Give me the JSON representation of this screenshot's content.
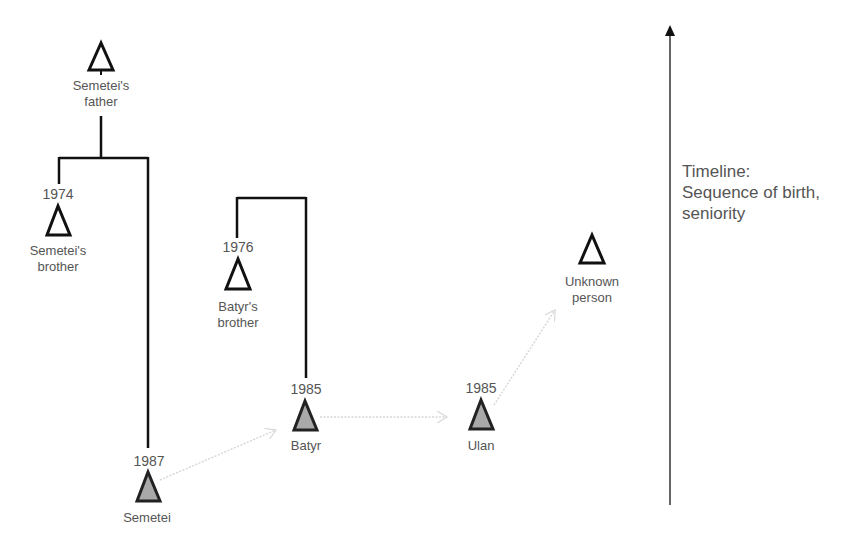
{
  "diagram": {
    "colors": {
      "line": "#111111",
      "text": "#555555",
      "ego_fill": "#a9a9a9",
      "arrow_dotted": "#d8d8d8"
    },
    "nodes": [
      {
        "id": "father",
        "label_lines": [
          "Semetei's",
          "father"
        ],
        "year": null,
        "filled": false
      },
      {
        "id": "semetei_brother",
        "label_lines": [
          "Semetei's",
          "brother"
        ],
        "year": "1974",
        "filled": false
      },
      {
        "id": "batyr_brother",
        "label_lines": [
          "Batyr's",
          "brother"
        ],
        "year": "1976",
        "filled": false
      },
      {
        "id": "semetei",
        "label_lines": [
          "Semetei"
        ],
        "year": "1987",
        "filled": true
      },
      {
        "id": "batyr",
        "label_lines": [
          "Batyr"
        ],
        "year": "1985",
        "filled": true
      },
      {
        "id": "ulan",
        "label_lines": [
          "Ulan"
        ],
        "year": "1985",
        "filled": true
      },
      {
        "id": "unknown",
        "label_lines": [
          "Unknown",
          "person"
        ],
        "year": null,
        "filled": false
      }
    ],
    "links": [
      {
        "from": "father",
        "to": "semetei_brother",
        "type": "sibling-bracket"
      },
      {
        "from": "father",
        "to": "semetei",
        "type": "sibling-bracket"
      },
      {
        "from": "batyr_brother",
        "to": "batyr",
        "type": "sibling-bracket"
      },
      {
        "from": "semetei",
        "to": "batyr",
        "type": "dotted-arrow"
      },
      {
        "from": "batyr",
        "to": "ulan",
        "type": "dotted-arrow"
      },
      {
        "from": "ulan",
        "to": "unknown",
        "type": "dotted-arrow"
      }
    ],
    "timeline": {
      "line1": "Timeline:",
      "line2": "Sequence of birth,",
      "line3": "seniority",
      "direction": "up"
    }
  }
}
